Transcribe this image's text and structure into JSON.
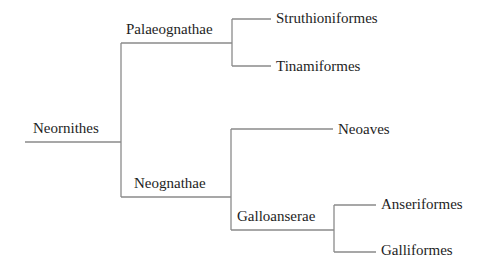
{
  "diagram": {
    "type": "phylogenetic-tree",
    "line_color": "#8a8a8a",
    "text_color": "#1e1e1e",
    "root": {
      "label": "Neornithes",
      "children": [
        {
          "label": "Palaeognathae",
          "children": [
            {
              "label": "Struthioniformes"
            },
            {
              "label": "Tinamiformes"
            }
          ]
        },
        {
          "label": "Neognathae",
          "children": [
            {
              "label": "Neoaves"
            },
            {
              "label": "Galloanserae",
              "children": [
                {
                  "label": "Anseriformes"
                },
                {
                  "label": "Galliformes"
                }
              ]
            }
          ]
        }
      ]
    }
  },
  "labels": {
    "neornithes": "Neornithes",
    "palaeognathae": "Palaeognathae",
    "struthioniformes": "Struthioniformes",
    "tinamiformes": "Tinamiformes",
    "neognathae": "Neognathae",
    "neoaves": "Neoaves",
    "galloanserae": "Galloanserae",
    "anseriformes": "Anseriformes",
    "galliformes": "Galliformes"
  }
}
